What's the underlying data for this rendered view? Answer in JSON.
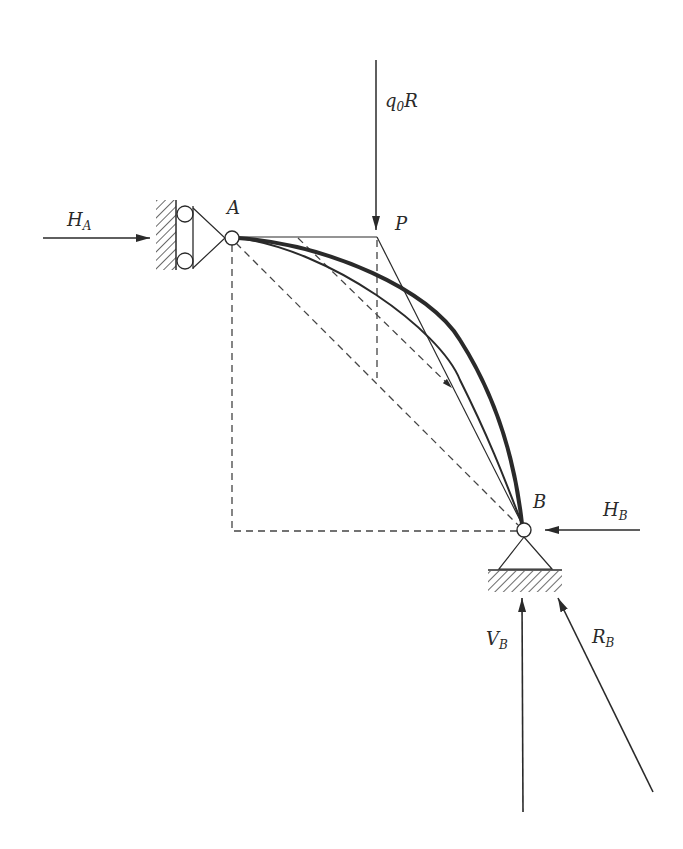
{
  "diagram": {
    "type": "structural arch with supports and reactions",
    "colors": {
      "ink": "#2a2a2a",
      "background": "#ffffff"
    },
    "labels": {
      "load": {
        "main": "q",
        "sub": "0",
        "tail": "R"
      },
      "point_A": "A",
      "point_P": "P",
      "point_B": "B",
      "reaction_HA": {
        "main": "H",
        "sub": "A"
      },
      "reaction_HB": {
        "main": "H",
        "sub": "B"
      },
      "reaction_VB": {
        "main": "V",
        "sub": "B"
      },
      "reaction_RB": {
        "main": "R",
        "sub": "B"
      }
    },
    "elements": [
      "roller-support-A",
      "pinned-support-B",
      "arch-curve-thick",
      "arch-curve-thin",
      "chord-A-B-dashed",
      "tangent-A-P",
      "line-P-B",
      "dashed-rectangle",
      "load-arrow-q0R",
      "arrow-HA",
      "arrow-HB",
      "arrow-VB",
      "arrow-RB"
    ]
  }
}
